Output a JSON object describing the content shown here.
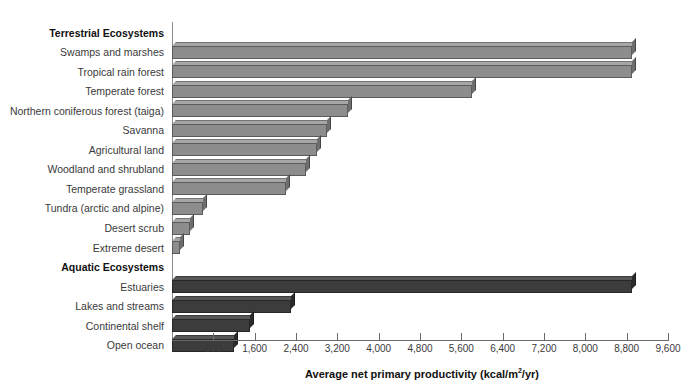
{
  "chart_data": {
    "type": "bar",
    "orientation": "horizontal",
    "title": "",
    "xlabel": "Average net primary productivity (kcal/m2/yr)",
    "xlabel_parts": {
      "before": "Average net primary productivity (kcal/m",
      "sup": "2",
      "after": "/yr)"
    },
    "ylabel": "",
    "xlim": [
      0,
      9600
    ],
    "xticks": [
      800,
      1600,
      2400,
      3200,
      4000,
      4800,
      5600,
      6400,
      7200,
      8000,
      8800,
      9600
    ],
    "xticklabels": [
      "800",
      "1,600",
      "2,400",
      "3,200",
      "4,000",
      "4,800",
      "5,600",
      "6,400",
      "7,200",
      "8,000",
      "8,800",
      "9,600"
    ],
    "grid": false,
    "legend": "none",
    "groups": [
      {
        "name": "Terrestrial Ecosystems",
        "color": "#8d8d8d",
        "categories": [
          "Swamps and marshes",
          "Tropical rain forest",
          "Temperate forest",
          "Northern coniferous forest (taiga)",
          "Savanna",
          "Agricultural land",
          "Woodland and shrubland",
          "Temperate grassland",
          "Tundra (arctic and alpine)",
          "Desert scrub",
          "Extreme desert"
        ],
        "values": [
          8900,
          8900,
          5800,
          3400,
          3000,
          2800,
          2600,
          2200,
          600,
          350,
          150
        ]
      },
      {
        "name": "Aquatic Ecosystems",
        "color": "#3c3c3c",
        "categories": [
          "Estuaries",
          "Lakes and streams",
          "Continental shelf",
          "Open ocean"
        ],
        "values": [
          8900,
          2300,
          1500,
          1200
        ]
      }
    ]
  },
  "axis": {
    "title_before": "Average net primary productivity (kcal/m",
    "title_sup": "2",
    "title_after": "/yr)"
  },
  "rows": [
    {
      "label": "Terrestrial Ecosystems",
      "kind": "group"
    },
    {
      "label": "Swamps and marshes",
      "kind": "bar",
      "group": "terrestrial",
      "value": 8900
    },
    {
      "label": "Tropical rain forest",
      "kind": "bar",
      "group": "terrestrial",
      "value": 8900
    },
    {
      "label": "Temperate forest",
      "kind": "bar",
      "group": "terrestrial",
      "value": 5800
    },
    {
      "label": "Northern coniferous forest (taiga)",
      "kind": "bar",
      "group": "terrestrial",
      "value": 3400
    },
    {
      "label": "Savanna",
      "kind": "bar",
      "group": "terrestrial",
      "value": 3000
    },
    {
      "label": "Agricultural land",
      "kind": "bar",
      "group": "terrestrial",
      "value": 2800
    },
    {
      "label": "Woodland and shrubland",
      "kind": "bar",
      "group": "terrestrial",
      "value": 2600
    },
    {
      "label": "Temperate grassland",
      "kind": "bar",
      "group": "terrestrial",
      "value": 2200
    },
    {
      "label": "Tundra (arctic and alpine)",
      "kind": "bar",
      "group": "terrestrial",
      "value": 600
    },
    {
      "label": "Desert scrub",
      "kind": "bar",
      "group": "terrestrial",
      "value": 350
    },
    {
      "label": "Extreme desert",
      "kind": "bar",
      "group": "terrestrial",
      "value": 150
    },
    {
      "label": "Aquatic Ecosystems",
      "kind": "group"
    },
    {
      "label": "Estuaries",
      "kind": "bar",
      "group": "aquatic",
      "value": 8900
    },
    {
      "label": "Lakes and streams",
      "kind": "bar",
      "group": "aquatic",
      "value": 2300
    },
    {
      "label": "Continental shelf",
      "kind": "bar",
      "group": "aquatic",
      "value": 1500
    },
    {
      "label": "Open ocean",
      "kind": "bar",
      "group": "aquatic",
      "value": 1200
    }
  ]
}
